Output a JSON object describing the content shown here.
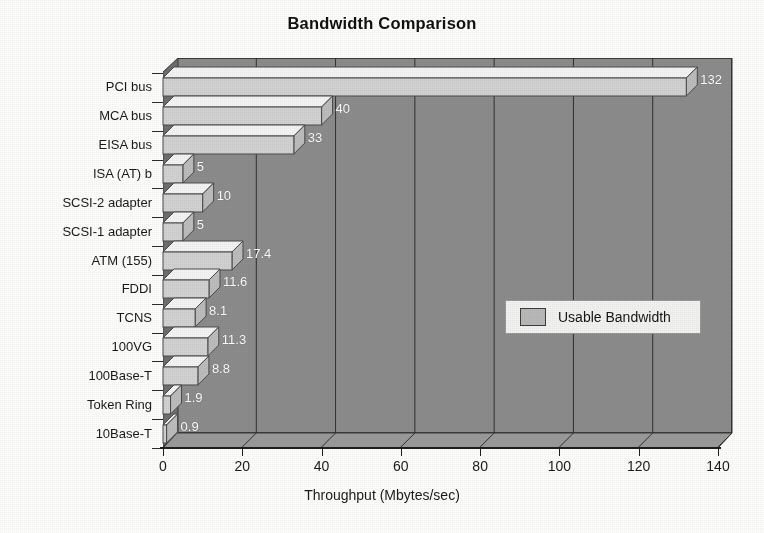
{
  "chart_data": {
    "type": "bar",
    "orientation": "horizontal",
    "title": "Bandwidth Comparison",
    "xlabel": "Throughput (Mbytes/sec)",
    "ylabel": "",
    "xlim": [
      0,
      140
    ],
    "xticks": [
      "0",
      "20",
      "40",
      "60",
      "80",
      "100",
      "120",
      "140"
    ],
    "grid": true,
    "legend_position": "inside-right",
    "style": "3d-bars",
    "categories": [
      "PCI bus",
      "MCA bus",
      "EISA bus",
      "ISA (AT) b",
      "SCSI-2 adapter",
      "SCSI-1 adapter",
      "ATM (155)",
      "FDDI",
      "TCNS",
      "100VG",
      "100Base-T",
      "Token Ring",
      "10Base-T"
    ],
    "series": [
      {
        "name": "Usable Bandwidth",
        "values": [
          132,
          40,
          33,
          5,
          10,
          5,
          17.4,
          11.6,
          8.1,
          11.3,
          8.8,
          1.9,
          0.9
        ],
        "value_labels": [
          "132",
          "40",
          "33",
          "5",
          "10",
          "5",
          "17.4",
          "11.6",
          "8.1",
          "11.3",
          "8.8",
          "1.9",
          "0.9"
        ],
        "color": "#d2d2d2"
      }
    ],
    "legend": [
      {
        "label": "Usable Bandwidth",
        "color": "#b9b9b9"
      }
    ]
  },
  "colors": {
    "plot_background": "#8c8c8c",
    "wall": "#6e6e6e",
    "floor": "#9a9a9a",
    "bar_face": "#d2d2d2",
    "bar_top": "#f4f4f4",
    "bar_side": "#bdbdbd",
    "gridline": "#2f2f2f",
    "axis": "#1e1e1e",
    "value_label": "#ffffff",
    "page_background": "#fdfdfb"
  }
}
